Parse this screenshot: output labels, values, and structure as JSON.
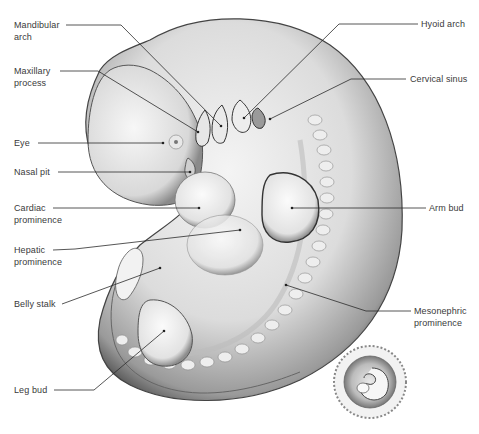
{
  "figure": {
    "labels_left": [
      {
        "id": "mandibular-arch",
        "text": "Mandibular\narch",
        "x": 14,
        "y": 19
      },
      {
        "id": "maxillary-process",
        "text": "Maxillary\nprocess",
        "x": 14,
        "y": 65
      },
      {
        "id": "eye",
        "text": "Eye",
        "x": 14,
        "y": 137
      },
      {
        "id": "nasal-pit",
        "text": "Nasal pit",
        "x": 14,
        "y": 166
      },
      {
        "id": "cardiac-prominence",
        "text": "Cardiac\nprominence",
        "x": 14,
        "y": 202
      },
      {
        "id": "hepatic-prominence",
        "text": "Hepatic\nprominence",
        "x": 14,
        "y": 244
      },
      {
        "id": "belly-stalk",
        "text": "Belly stalk",
        "x": 14,
        "y": 297
      },
      {
        "id": "leg-bud",
        "text": "Leg bud",
        "x": 14,
        "y": 383
      }
    ],
    "labels_right": [
      {
        "id": "hyoid-arch",
        "text": "Hyoid arch",
        "x": 421,
        "y": 18
      },
      {
        "id": "cervical-sinus",
        "text": "Cervical sinus",
        "x": 410,
        "y": 73
      },
      {
        "id": "arm-bud",
        "text": "Arm bud",
        "x": 429,
        "y": 202
      },
      {
        "id": "mesonephric-prominence",
        "text": "Mesonephric\nprominence",
        "x": 414,
        "y": 305
      }
    ],
    "leaders": [
      {
        "id": "mandibular-arch",
        "points": "66,25 121,25 221,126"
      },
      {
        "id": "maxillary-process",
        "points": "60,71 98,71 198,132"
      },
      {
        "id": "eye",
        "points": "38,143 163,143"
      },
      {
        "id": "nasal-pit",
        "points": "58,172 190,172"
      },
      {
        "id": "cardiac-prominence",
        "points": "53,208 199,208"
      },
      {
        "id": "hepatic-prominence",
        "points": "53,250 75,249 240,230"
      },
      {
        "id": "belly-stalk",
        "points": "62,304 160,268"
      },
      {
        "id": "leg-bud",
        "points": "54,390 94,390 164,331"
      },
      {
        "id": "hyoid-arch",
        "points": "418,24 339,24 244,118"
      },
      {
        "id": "cervical-sinus",
        "points": "406,79 351,79 270,119"
      },
      {
        "id": "arm-bud",
        "points": "426,208 292,208"
      },
      {
        "id": "mesonephric-prominence",
        "points": "411,311 366,311 286,285"
      }
    ],
    "inset": {
      "description": "Embryo within chorionic sac (small inset)",
      "cx": 370,
      "cy": 382,
      "r": 37
    }
  }
}
